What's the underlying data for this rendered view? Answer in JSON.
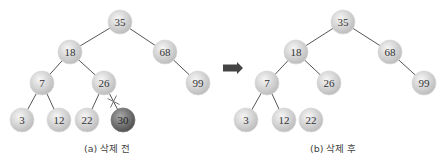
{
  "colors": {
    "node_fill_light": "#f0f0f0",
    "node_fill_dark": "#b8b8b8",
    "deleted_fill_light": "#a0a0a0",
    "deleted_fill_dark": "#555555",
    "edge": "#555555",
    "arrow": "#444444",
    "text": "#333333"
  },
  "node_radius": 12,
  "trees": [
    {
      "id": "before",
      "caption": "(a) 삭제 전",
      "caption_pos": [
        84,
        147
      ],
      "nodes": [
        {
          "key": "35",
          "x": 120,
          "y": 22
        },
        {
          "key": "18",
          "x": 70,
          "y": 52
        },
        {
          "key": "68",
          "x": 165,
          "y": 52
        },
        {
          "key": "7",
          "x": 42,
          "y": 83
        },
        {
          "key": "26",
          "x": 104,
          "y": 83
        },
        {
          "key": "99",
          "x": 198,
          "y": 83
        },
        {
          "key": "3",
          "x": 22,
          "y": 120
        },
        {
          "key": "12",
          "x": 59,
          "y": 120
        },
        {
          "key": "22",
          "x": 87,
          "y": 120
        },
        {
          "key": "30",
          "x": 123,
          "y": 120,
          "deleted": true
        }
      ],
      "edges": [
        [
          "35",
          "18"
        ],
        [
          "35",
          "68"
        ],
        [
          "18",
          "7"
        ],
        [
          "18",
          "26"
        ],
        [
          "68",
          "99"
        ],
        [
          "7",
          "3"
        ],
        [
          "7",
          "12"
        ],
        [
          "26",
          "22"
        ],
        [
          "26",
          "30"
        ]
      ],
      "cut_edge": [
        "26",
        "30"
      ]
    },
    {
      "id": "after",
      "caption": "(b) 삭제 후",
      "caption_pos": [
        310,
        147
      ],
      "nodes": [
        {
          "key": "35",
          "x": 343,
          "y": 22
        },
        {
          "key": "18",
          "x": 296,
          "y": 52
        },
        {
          "key": "68",
          "x": 390,
          "y": 52
        },
        {
          "key": "7",
          "x": 267,
          "y": 83
        },
        {
          "key": "26",
          "x": 329,
          "y": 83
        },
        {
          "key": "99",
          "x": 424,
          "y": 83
        },
        {
          "key": "3",
          "x": 246,
          "y": 120
        },
        {
          "key": "12",
          "x": 284,
          "y": 120
        },
        {
          "key": "22",
          "x": 311,
          "y": 120
        }
      ],
      "edges": [
        [
          "35",
          "18"
        ],
        [
          "35",
          "68"
        ],
        [
          "18",
          "7"
        ],
        [
          "18",
          "26"
        ],
        [
          "68",
          "99"
        ],
        [
          "7",
          "3"
        ],
        [
          "7",
          "12"
        ]
      ]
    }
  ],
  "arrow": {
    "x": 223,
    "y": 68,
    "width": 20,
    "height": 12,
    "direction": "right"
  }
}
